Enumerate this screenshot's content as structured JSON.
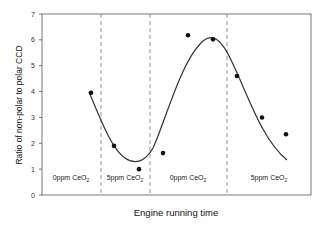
{
  "chart_data": {
    "type": "scatter",
    "title": "",
    "xlabel": "Engine running time",
    "ylabel": "Ratio of non-polar to polar CCD",
    "ylim": [
      0,
      7
    ],
    "yticks": [
      "0",
      "1",
      "2",
      "3",
      "4",
      "5",
      "6",
      "7"
    ],
    "grid": false,
    "legend": "none",
    "segments": [
      {
        "label": "0ppm CeO",
        "sub": "2"
      },
      {
        "label": "5ppm CeO",
        "sub": "2"
      },
      {
        "label": "0ppm CeO",
        "sub": "2"
      },
      {
        "label": "5ppm CeO",
        "sub": "2"
      }
    ],
    "series": [
      {
        "name": "measured",
        "kind": "points",
        "x": [
          1,
          2,
          3,
          4,
          5,
          6,
          7,
          8,
          9
        ],
        "values": [
          3.95,
          1.9,
          1.0,
          1.62,
          6.18,
          6.02,
          4.6,
          3.0,
          2.35
        ]
      },
      {
        "name": "fit",
        "kind": "smooth-line",
        "description": "sinusoidal fit curve from ~4.0 dipping to ~1.25 then peaking ~6.1 and falling to ~1.35"
      }
    ]
  }
}
